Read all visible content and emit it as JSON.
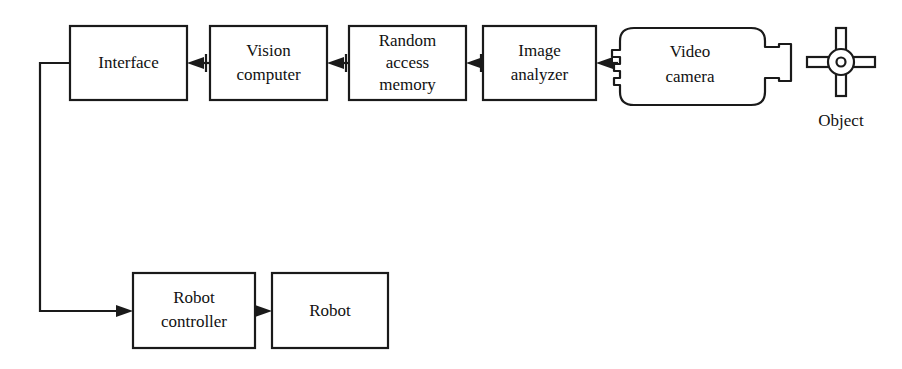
{
  "diagram": {
    "type": "block-flow-diagram",
    "background_color": "#ffffff",
    "line_color": "#1a1a1a",
    "text_color": "#111111"
  },
  "nodes": {
    "interface": {
      "label": "Interface",
      "lines": [
        "Interface"
      ],
      "shape": "rectangle",
      "x": 70,
      "y": 26,
      "width": 117,
      "height": 74
    },
    "vision_computer": {
      "label": "Vision computer",
      "lines": [
        "Vision",
        "computer"
      ],
      "shape": "rectangle",
      "x": 210,
      "y": 26,
      "width": 117,
      "height": 74
    },
    "random_access_memory": {
      "label": "Random access memory",
      "lines": [
        "Random",
        "access",
        "memory"
      ],
      "shape": "rectangle",
      "x": 349,
      "y": 26,
      "width": 117,
      "height": 74
    },
    "image_analyzer": {
      "label": "Image analyzer",
      "lines": [
        "Image",
        "analyzer"
      ],
      "shape": "rectangle",
      "x": 483,
      "y": 26,
      "width": 113,
      "height": 74
    },
    "video_camera": {
      "label": "Video camera",
      "lines": [
        "Video",
        "camera"
      ],
      "shape": "camera-outline",
      "x": 620,
      "y": 28,
      "width": 145,
      "height": 77
    },
    "object": {
      "label": "Object",
      "lines": [
        "Object"
      ],
      "shape": "cross-hub",
      "center_x": 841,
      "center_y": 62,
      "radius": 13
    },
    "robot_controller": {
      "label": "Robot controller",
      "lines": [
        "Robot",
        "controller"
      ],
      "shape": "rectangle",
      "x": 133,
      "y": 273,
      "width": 122,
      "height": 75
    },
    "robot": {
      "label": "Robot",
      "lines": [
        "Robot"
      ],
      "shape": "rectangle",
      "x": 272,
      "y": 273,
      "width": 116,
      "height": 75
    }
  },
  "connections": [
    {
      "name": "camera-to-image-analyzer",
      "from": "video_camera",
      "to": "image_analyzer",
      "direction": "left"
    },
    {
      "name": "image-analyzer-to-memory",
      "from": "image_analyzer",
      "to": "random_access_memory",
      "direction": "left"
    },
    {
      "name": "memory-to-vision-computer",
      "from": "random_access_memory",
      "to": "vision_computer",
      "direction": "left"
    },
    {
      "name": "vision-computer-to-interface",
      "from": "vision_computer",
      "to": "interface",
      "direction": "left"
    },
    {
      "name": "interface-to-robot-controller",
      "from": "interface",
      "to": "robot_controller",
      "direction": "down-right"
    },
    {
      "name": "robot-controller-to-robot",
      "from": "robot_controller",
      "to": "robot",
      "direction": "right"
    }
  ]
}
